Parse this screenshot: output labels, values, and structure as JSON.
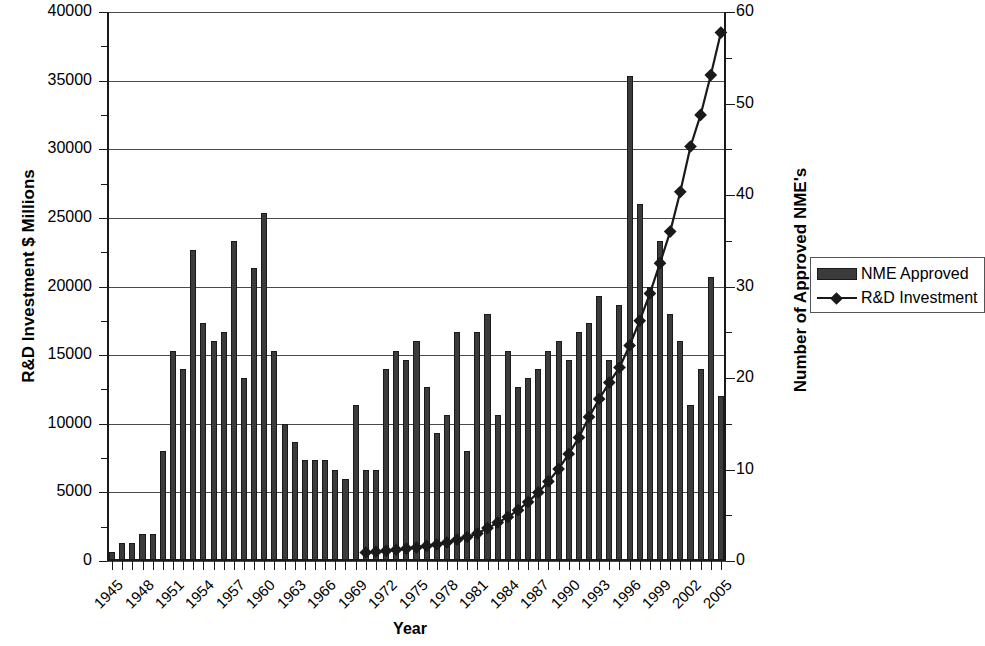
{
  "chart_data": {
    "type": "bar",
    "title": "",
    "xlabel": "Year",
    "ylabel": "R&D Investment $ Millions",
    "ylabel_right": "Number of Approved NME's",
    "ylim": [
      0,
      40000
    ],
    "ylim_right": [
      0,
      60
    ],
    "ytick_step": 5000,
    "ytick_step_right": 10,
    "grid": true,
    "legend_position": "right",
    "x": [
      1945,
      1946,
      1947,
      1948,
      1949,
      1950,
      1951,
      1952,
      1953,
      1954,
      1955,
      1956,
      1957,
      1958,
      1959,
      1960,
      1961,
      1962,
      1963,
      1964,
      1965,
      1966,
      1967,
      1968,
      1969,
      1970,
      1971,
      1972,
      1973,
      1974,
      1975,
      1976,
      1977,
      1978,
      1979,
      1980,
      1981,
      1982,
      1983,
      1984,
      1985,
      1986,
      1987,
      1988,
      1989,
      1990,
      1991,
      1992,
      1993,
      1994,
      1995,
      1996,
      1997,
      1998,
      1999,
      2000,
      2001,
      2002,
      2003,
      2004,
      2005
    ],
    "xtick_labels": [
      "1945",
      "1948",
      "1951",
      "1954",
      "1957",
      "1960",
      "1963",
      "1966",
      "1969",
      "1972",
      "1975",
      "1978",
      "1981",
      "1984",
      "1987",
      "1990",
      "1993",
      "1996",
      "1999",
      "2002",
      "2005"
    ],
    "series": [
      {
        "name": "NME Approved",
        "axis": "right",
        "render": "bar",
        "color": "#3b3b3b",
        "values": [
          1,
          2,
          2,
          3,
          3,
          12,
          23,
          21,
          34,
          26,
          24,
          25,
          35,
          20,
          32,
          38,
          23,
          15,
          13,
          11,
          11,
          11,
          10,
          9,
          17,
          10,
          10,
          21,
          23,
          22,
          24,
          19,
          14,
          16,
          25,
          12,
          25,
          27,
          16,
          23,
          19,
          20,
          21,
          23,
          24,
          22,
          25,
          26,
          29,
          22,
          28,
          53,
          39,
          30,
          35,
          27,
          24,
          17,
          21,
          31,
          18
        ]
      },
      {
        "name": "R&D Investment",
        "axis": "left",
        "render": "line",
        "color": "#1a1a1a",
        "x": [
          1970,
          1971,
          1972,
          1973,
          1974,
          1975,
          1976,
          1977,
          1978,
          1979,
          1980,
          1981,
          1982,
          1983,
          1984,
          1985,
          1986,
          1987,
          1988,
          1989,
          1990,
          1991,
          1992,
          1993,
          1994,
          1995,
          1996,
          1997,
          1998,
          1999,
          2000,
          2001,
          2002,
          2003,
          2004,
          2005
        ],
        "values": [
          620,
          680,
          740,
          820,
          900,
          980,
          1100,
          1200,
          1350,
          1550,
          1750,
          2000,
          2400,
          2800,
          3200,
          3700,
          4300,
          5000,
          5800,
          6700,
          7800,
          9000,
          10500,
          11800,
          13000,
          14100,
          15700,
          17500,
          19500,
          21700,
          24000,
          26900,
          30200,
          32500,
          35400,
          38500
        ]
      }
    ]
  },
  "axis": {
    "left_ticks": [
      "0",
      "5000",
      "10000",
      "15000",
      "20000",
      "25000",
      "30000",
      "35000",
      "40000"
    ],
    "right_ticks": [
      "0",
      "10",
      "20",
      "30",
      "40",
      "50",
      "60"
    ],
    "left_title": "R&D Investment $ Millions",
    "right_title": "Number of Approved NME's",
    "x_title": "Year"
  },
  "legend": {
    "items": [
      {
        "label": "NME Approved",
        "type": "bar"
      },
      {
        "label": "R&D Investment",
        "type": "line"
      }
    ]
  }
}
